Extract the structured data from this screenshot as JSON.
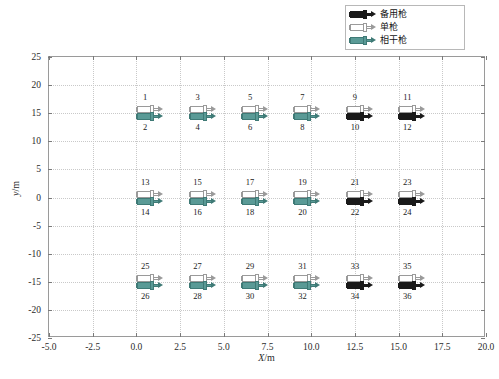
{
  "legend": {
    "position": "top-right",
    "items": [
      {
        "label": "备用枪",
        "key_icon": "gun-icon",
        "fill": "#1a1a1a",
        "stroke": "#1a1a1a"
      },
      {
        "label": "单枪",
        "key_icon": "gun-icon",
        "fill": "#ffffff",
        "stroke": "#9a9a9a"
      },
      {
        "label": "相干枪",
        "key_icon": "gun-icon",
        "fill": "#5a9a96",
        "stroke": "#3f7a76"
      }
    ]
  },
  "axes": {
    "xlabel_sym": "X",
    "xlabel_unit": "/m",
    "ylabel_sym": "y",
    "ylabel_unit": "/m",
    "xticks": [
      "-5.0",
      "-2.5",
      "0.0",
      "2.5",
      "5.0",
      "7.5",
      "10.0",
      "12.5",
      "15.0",
      "17.5",
      "20.0"
    ],
    "yticks": [
      "25",
      "20",
      "15",
      "10",
      "5",
      "0",
      "-5",
      "-10",
      "-15",
      "-20",
      "-25"
    ],
    "xlim": [
      -5.0,
      20.0
    ],
    "ylim": [
      -25,
      25
    ],
    "grid": true,
    "grid_color": "#c9c9c9",
    "frame_color": "#9a9a9a"
  },
  "chart_data": {
    "type": "scatter",
    "title": "",
    "xlabel": "X/m",
    "ylabel": "y/m",
    "xlim": [
      -5.0,
      20.0
    ],
    "ylim": [
      -25,
      25
    ],
    "xticks": [
      -5.0,
      -2.5,
      0.0,
      2.5,
      5.0,
      7.5,
      10.0,
      12.5,
      15.0,
      17.5,
      20.0
    ],
    "yticks": [
      25,
      20,
      15,
      10,
      5,
      0,
      -5,
      -10,
      -15,
      -20,
      -25
    ],
    "grid": true,
    "legend_position": "upper right",
    "series": [
      {
        "name": "备用枪",
        "color": "#1a1a1a"
      },
      {
        "name": "单枪",
        "color": "#ffffff"
      },
      {
        "name": "相干枪",
        "color": "#5a9a96"
      }
    ],
    "points": [
      {
        "x": 0.5,
        "y": 15,
        "upper_label": "1",
        "lower_label": "2",
        "type": "相干枪"
      },
      {
        "x": 3.5,
        "y": 15,
        "upper_label": "3",
        "lower_label": "4",
        "type": "相干枪"
      },
      {
        "x": 6.5,
        "y": 15,
        "upper_label": "5",
        "lower_label": "6",
        "type": "相干枪"
      },
      {
        "x": 9.5,
        "y": 15,
        "upper_label": "7",
        "lower_label": "8",
        "type": "相干枪"
      },
      {
        "x": 12.5,
        "y": 15,
        "upper_label": "9",
        "lower_label": "10",
        "type": "备用枪"
      },
      {
        "x": 15.5,
        "y": 15,
        "upper_label": "11",
        "lower_label": "12",
        "type": "备用枪"
      },
      {
        "x": 0.5,
        "y": 0,
        "upper_label": "13",
        "lower_label": "14",
        "type": "相干枪"
      },
      {
        "x": 3.5,
        "y": 0,
        "upper_label": "15",
        "lower_label": "16",
        "type": "相干枪"
      },
      {
        "x": 6.5,
        "y": 0,
        "upper_label": "17",
        "lower_label": "18",
        "type": "相干枪"
      },
      {
        "x": 9.5,
        "y": 0,
        "upper_label": "19",
        "lower_label": "20",
        "type": "相干枪"
      },
      {
        "x": 12.5,
        "y": 0,
        "upper_label": "21",
        "lower_label": "22",
        "type": "备用枪"
      },
      {
        "x": 15.5,
        "y": 0,
        "upper_label": "23",
        "lower_label": "24",
        "type": "备用枪"
      },
      {
        "x": 0.5,
        "y": -15,
        "upper_label": "25",
        "lower_label": "26",
        "type": "相干枪"
      },
      {
        "x": 3.5,
        "y": -15,
        "upper_label": "27",
        "lower_label": "28",
        "type": "相干枪"
      },
      {
        "x": 6.5,
        "y": -15,
        "upper_label": "29",
        "lower_label": "30",
        "type": "相干枪"
      },
      {
        "x": 9.5,
        "y": -15,
        "upper_label": "31",
        "lower_label": "32",
        "type": "相干枪"
      },
      {
        "x": 12.5,
        "y": -15,
        "upper_label": "33",
        "lower_label": "34",
        "type": "备用枪"
      },
      {
        "x": 15.5,
        "y": -15,
        "upper_label": "35",
        "lower_label": "36",
        "type": "备用枪"
      }
    ]
  }
}
